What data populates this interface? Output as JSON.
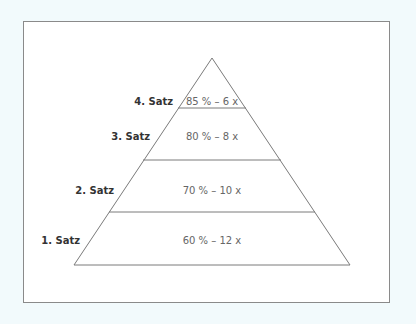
{
  "diagram": {
    "type": "pyramid",
    "colors": {
      "background": "#f2fafc",
      "frame_border": "#8a8a8a",
      "line": "#7a7a7a",
      "label": "#333333",
      "value": "#666666"
    },
    "levels": [
      {
        "label": "4. Satz",
        "value": "85 % – 6 x"
      },
      {
        "label": "3. Satz",
        "value": "80 % – 8 x"
      },
      {
        "label": "2. Satz",
        "value": "70 % – 10 x"
      },
      {
        "label": "1. Satz",
        "value": "60 % – 12 x"
      }
    ]
  }
}
